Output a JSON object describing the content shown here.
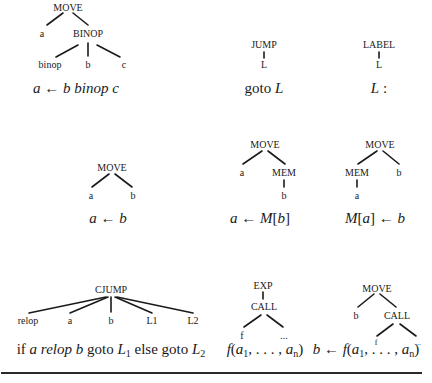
{
  "trees": [
    {
      "id": "move-binop",
      "nodes": {
        "root": "MOVE",
        "left": "a",
        "right": "BINOP",
        "op": "binop",
        "b": "b",
        "c": "c"
      },
      "caption": {
        "a": "a",
        "arrow": "←",
        "b": "b",
        "op": "binop",
        "c": "c"
      }
    },
    {
      "id": "jump",
      "nodes": {
        "root": "JUMP",
        "child": "L"
      },
      "caption": {
        "kw": "goto",
        "label": "L"
      }
    },
    {
      "id": "label",
      "nodes": {
        "root": "LABEL",
        "child": "L"
      },
      "caption": {
        "label": "L",
        "colon": ":"
      }
    },
    {
      "id": "move-simple",
      "nodes": {
        "root": "MOVE",
        "left": "a",
        "right": "b"
      },
      "caption": {
        "a": "a",
        "arrow": "←",
        "b": "b"
      }
    },
    {
      "id": "move-load",
      "nodes": {
        "root": "MOVE",
        "left": "a",
        "right": "MEM",
        "mem_child": "b"
      },
      "caption": {
        "a": "a",
        "arrow": "←",
        "M": "M",
        "lb": "[",
        "b": "b",
        "rb": "]"
      }
    },
    {
      "id": "move-store",
      "nodes": {
        "root": "MOVE",
        "left": "MEM",
        "right": "b",
        "mem_child": "a"
      },
      "caption": {
        "M": "M",
        "lb": "[",
        "a": "a",
        "rb": "]",
        "arrow": "←",
        "b": "b"
      }
    },
    {
      "id": "cjump",
      "nodes": {
        "root": "CJUMP",
        "c0": "relop",
        "c1": "a",
        "c2": "b",
        "c3": "L1",
        "c4": "L2"
      },
      "caption": {
        "if": "if",
        "a": "a",
        "relop": "relop",
        "b": "b",
        "goto1": "goto",
        "L": "L",
        "s1": "1",
        "else": "else",
        "goto2": "goto",
        "s2": "2"
      }
    },
    {
      "id": "exp-call",
      "nodes": {
        "root": "EXP",
        "call": "CALL",
        "f": "f",
        "args": "..."
      },
      "caption": {
        "f": "f",
        "open": "(",
        "a": "a",
        "s1": "1",
        "dots": ", . . . , ",
        "sn": "n",
        "close": ")"
      }
    },
    {
      "id": "move-call",
      "nodes": {
        "root": "MOVE",
        "left": "b",
        "call": "CALL",
        "f": "f",
        "args": "..."
      },
      "caption": {
        "b": "b",
        "arrow": "←",
        "f": "f",
        "open": "(",
        "a": "a",
        "s1": "1",
        "dots": ", . . . , ",
        "sn": "n",
        "close": ")"
      }
    }
  ]
}
